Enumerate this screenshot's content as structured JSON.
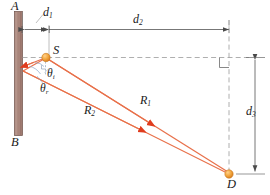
{
  "figure": {
    "type": "optics-ray-diagram",
    "background_color": "#ffffff",
    "points": {
      "A": "A",
      "B": "B",
      "S": "S",
      "D": "D"
    },
    "dimensions": {
      "d1_base": "d",
      "d1_sub": "1",
      "d2_base": "d",
      "d2_sub": "2",
      "d3_base": "d",
      "d3_sub": "3"
    },
    "rays": {
      "R1_base": "R",
      "R1_sub": "1",
      "R2_base": "R",
      "R2_sub": "2"
    },
    "angles": {
      "theta_i_base": "θ",
      "theta_i_sub": "i",
      "theta_r_base": "θ",
      "theta_r_sub": "r"
    },
    "colors": {
      "wall_fill": "#a8847a",
      "wall_edge": "#6e5049",
      "ray_line": "#e8704a",
      "ray_arrow": "#e03c1e",
      "source_dot": "#f0a03c",
      "detector_dot": "#f0a03c",
      "dimension_line": "#6a6a6a",
      "dashed_guide": "#9a9a9a",
      "label_text": "#1a1a1a"
    },
    "caption": ""
  }
}
